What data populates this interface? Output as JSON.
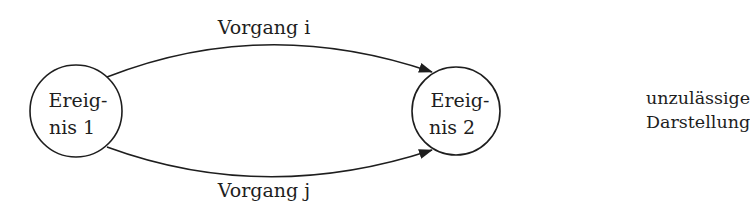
{
  "diagram": {
    "type": "event-node network (activity-on-arrow)",
    "nodes": [
      {
        "id": "n1",
        "line1": "Ereig-",
        "line2": "nis 1"
      },
      {
        "id": "n2",
        "line1": "Ereig-",
        "line2": "nis 2"
      }
    ],
    "edges": [
      {
        "from": "n1",
        "to": "n2",
        "label": "Vorgang i",
        "position": "upper arc"
      },
      {
        "from": "n1",
        "to": "n2",
        "label": "Vorgang j",
        "position": "lower arc"
      }
    ],
    "caption": {
      "line1": "unzulässige",
      "line2": "Darstellung"
    },
    "colors": {
      "stroke": "#1e1e1e",
      "background": "#ffffff"
    }
  }
}
